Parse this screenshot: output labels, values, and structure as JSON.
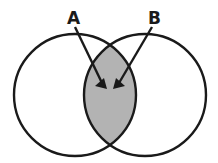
{
  "diagram": {
    "type": "venn",
    "labels": {
      "a": "A",
      "b": "B"
    },
    "colors": {
      "stroke": "#1a1a1a",
      "intersection_fill": "#b3b3b3",
      "background": "#ffffff"
    },
    "circles": [
      {
        "name": "A",
        "cx": 75,
        "cy": 95,
        "r": 61
      },
      {
        "name": "B",
        "cx": 145,
        "cy": 95,
        "r": 61
      }
    ],
    "highlighted_region": "intersection of A and B"
  }
}
